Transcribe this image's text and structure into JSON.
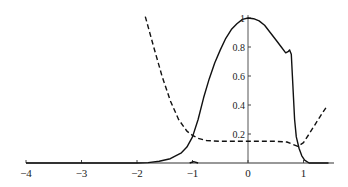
{
  "chart_data": {
    "type": "line",
    "title": "",
    "xlabel": "",
    "ylabel": "",
    "xlim": [
      -4,
      1.5
    ],
    "ylim": [
      0,
      1.0
    ],
    "grid": false,
    "legend": null,
    "x_ticks": [
      -4,
      -3,
      -2,
      -1,
      0,
      1
    ],
    "x_tick_labels": [
      "−4",
      "−3",
      "−2",
      "−1",
      "0",
      "1"
    ],
    "y_ticks": [
      0.2,
      0.4,
      0.6,
      0.8,
      1.0
    ],
    "y_tick_labels": [
      "0.2",
      "0.4",
      "0.6",
      "0.8",
      "1"
    ],
    "series": [
      {
        "name": "solid",
        "style": "solid",
        "color": "#111111",
        "points": [
          [
            -4.0,
            0.0
          ],
          [
            -3.0,
            0.0
          ],
          [
            -2.0,
            0.0
          ],
          [
            -1.8,
            0.003
          ],
          [
            -1.6,
            0.012
          ],
          [
            -1.4,
            0.03
          ],
          [
            -1.2,
            0.07
          ],
          [
            -1.1,
            0.11
          ],
          [
            -1.0,
            0.18
          ],
          [
            -0.9,
            0.3
          ],
          [
            -0.8,
            0.45
          ],
          [
            -0.7,
            0.58
          ],
          [
            -0.6,
            0.69
          ],
          [
            -0.5,
            0.78
          ],
          [
            -0.4,
            0.86
          ],
          [
            -0.3,
            0.92
          ],
          [
            -0.2,
            0.96
          ],
          [
            -0.1,
            0.99
          ],
          [
            0.0,
            1.0
          ],
          [
            0.1,
            0.995
          ],
          [
            0.2,
            0.98
          ],
          [
            0.3,
            0.95
          ],
          [
            0.4,
            0.9
          ],
          [
            0.5,
            0.85
          ],
          [
            0.6,
            0.8
          ],
          [
            0.68,
            0.76
          ],
          [
            0.73,
            0.77
          ],
          [
            0.75,
            0.78
          ],
          [
            0.78,
            0.75
          ],
          [
            0.8,
            0.6
          ],
          [
            0.82,
            0.45
          ],
          [
            0.84,
            0.3
          ],
          [
            0.87,
            0.18
          ],
          [
            0.92,
            0.1
          ],
          [
            0.97,
            0.05
          ],
          [
            1.02,
            0.02
          ],
          [
            1.1,
            0.0
          ],
          [
            1.45,
            0.0
          ]
        ]
      },
      {
        "name": "dashed",
        "style": "dashed",
        "color": "#111111",
        "points": [
          [
            -1.85,
            1.01
          ],
          [
            -1.7,
            0.8
          ],
          [
            -1.55,
            0.6
          ],
          [
            -1.4,
            0.43
          ],
          [
            -1.25,
            0.3
          ],
          [
            -1.1,
            0.22
          ],
          [
            -1.0,
            0.19
          ],
          [
            -0.9,
            0.17
          ],
          [
            -0.75,
            0.155
          ],
          [
            -0.5,
            0.15
          ],
          [
            -0.25,
            0.15
          ],
          [
            0.0,
            0.15
          ],
          [
            0.25,
            0.15
          ],
          [
            0.5,
            0.15
          ],
          [
            0.7,
            0.145
          ],
          [
            0.8,
            0.13
          ],
          [
            0.9,
            0.115
          ],
          [
            1.0,
            0.14
          ],
          [
            1.1,
            0.2
          ],
          [
            1.2,
            0.26
          ],
          [
            1.3,
            0.32
          ],
          [
            1.42,
            0.39
          ]
        ]
      },
      {
        "name": "small-bump",
        "style": "solid",
        "color": "#111111",
        "points": [
          [
            -1.05,
            0.0
          ],
          [
            -0.98,
            0.01
          ],
          [
            -0.9,
            0.0
          ]
        ]
      }
    ]
  },
  "axes": {
    "x_axis_label": "",
    "y_axis_label": ""
  }
}
